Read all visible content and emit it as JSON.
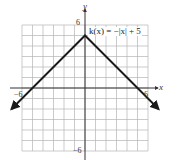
{
  "chart_data": {
    "type": "line",
    "title": "",
    "function_label": "k(x) = −|x| + 5",
    "xlabel": "x",
    "ylabel": "y",
    "xlim": [
      -6,
      6
    ],
    "ylim": [
      -6,
      6
    ],
    "grid": true,
    "grid_step": 1,
    "tick_labels": {
      "x": [
        {
          "value": -6,
          "label": "−6"
        },
        {
          "value": 6,
          "label": "6"
        }
      ],
      "y": [
        {
          "value": 6,
          "label": "6"
        },
        {
          "value": -6,
          "label": "−6"
        }
      ]
    },
    "series": [
      {
        "name": "k(x) = −|x| + 5",
        "x": [
          -7,
          -6,
          -5,
          -4,
          -3,
          -2,
          -1,
          0,
          1,
          2,
          3,
          4,
          5,
          6,
          7
        ],
        "values": [
          -2,
          -1,
          0,
          1,
          2,
          3,
          4,
          5,
          4,
          3,
          2,
          1,
          0,
          -1,
          -2
        ],
        "vertex": [
          0,
          5
        ],
        "x_intercepts": [
          -5,
          5
        ],
        "arrows_at_ends": true
      }
    ],
    "colors": {
      "curve": "#1a1a1a",
      "grid": "#b5b5b5",
      "axes": "#333333"
    }
  }
}
